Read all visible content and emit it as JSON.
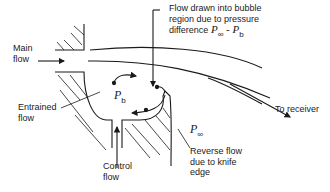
{
  "diagram": {
    "type": "fluidic bubble-region flow schematic",
    "labels": {
      "main_flow": [
        "Main",
        "flow"
      ],
      "flow_drawn": [
        "Flow drawn into bubble",
        "region due to pressure",
        "difference"
      ],
      "pressure_diff": {
        "p1": "P",
        "p1_sub": "∞",
        "minus": " - ",
        "p2": "P",
        "p2_sub": "b"
      },
      "to_receiver": "To receiver",
      "entrained_flow": [
        "Entrained",
        "flow"
      ],
      "bubble_pressure": {
        "p": "P",
        "sub": "b"
      },
      "ambient_pressure": {
        "p": "P",
        "sub": "∞"
      },
      "control_flow": [
        "Control",
        "flow"
      ],
      "reverse_flow": [
        "Reverse flow",
        "due to knife",
        "edge"
      ]
    },
    "colors": {
      "line": "#1a1a1a",
      "background": "#ffffff"
    }
  }
}
